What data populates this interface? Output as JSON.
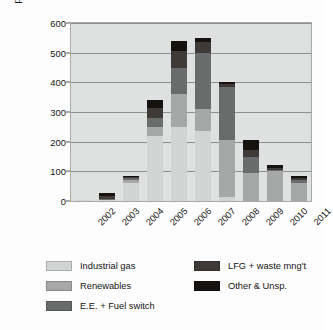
{
  "chart_data": {
    "type": "bar",
    "stacked": true,
    "title": "",
    "xlabel": "",
    "ylabel": "pre-2013 volumes transacted (MtCo2e)",
    "ylabel_parts": {
      "before_sub": "pre-2013 volumes transacted (MtCo",
      "sub": "2",
      "after_sub": "e)"
    },
    "categories": [
      "2002",
      "2003",
      "2004",
      "2005",
      "2006",
      "2007",
      "2008",
      "2009",
      "2010",
      "2011"
    ],
    "ylim": [
      0,
      600
    ],
    "yticks": [
      0,
      100,
      200,
      300,
      400,
      500,
      600
    ],
    "ytick_labels": [
      "0",
      "100",
      "200",
      "300",
      "400",
      "500",
      "600"
    ],
    "grid": true,
    "legend_position": "bottom",
    "series": [
      {
        "name": "Industrial gas",
        "color": "#d2d3d3",
        "values": [
          3,
          2,
          62,
          220,
          250,
          235,
          15,
          0,
          0,
          0
        ]
      },
      {
        "name": "Renewables",
        "color": "#a6a7a7",
        "values": [
          0,
          0,
          10,
          30,
          110,
          75,
          190,
          95,
          100,
          62
        ]
      },
      {
        "name": "E.E. + Fuel switch",
        "color": "#6a6b6b",
        "values": [
          0,
          5,
          5,
          30,
          90,
          190,
          180,
          55,
          5,
          8
        ]
      },
      {
        "name": "LFG + waste mng't",
        "color": "#3f3a38",
        "values": [
          0,
          8,
          5,
          35,
          55,
          35,
          10,
          22,
          8,
          8
        ]
      },
      {
        "name": "Other & Unsp.",
        "color": "#151210",
        "values": [
          0,
          10,
          3,
          25,
          35,
          15,
          5,
          35,
          7,
          7
        ]
      }
    ],
    "totals": [
      3,
      25,
      85,
      340,
      540,
      550,
      400,
      207,
      120,
      85
    ]
  },
  "legend": {
    "left_column": [
      "Industrial gas",
      "Renewables",
      "E.E. + Fuel switch"
    ],
    "right_column": [
      "LFG + waste mng't",
      "Other & Unsp."
    ]
  },
  "style": {
    "plot_background": "#dfe0e0",
    "gridline_color": "#8e8f8f",
    "axis_color": "#a8a9a9",
    "text_color": "#141414",
    "page_background": "#fdfdfd"
  }
}
